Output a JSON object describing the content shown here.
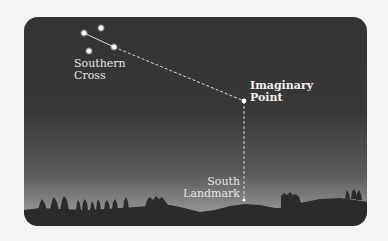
{
  "diagram": {
    "colors": {
      "page_background": "#f4f4f4",
      "sky_top": "#333333",
      "sky_horizon": "#a8a8a8",
      "ground": "#2a2a2a",
      "stars": "#ffffff",
      "guide_line": "#dddddd",
      "label_text": "#e6e6e6"
    },
    "labels": {
      "southern_cross": {
        "line1": "Southern",
        "line2": "Cross"
      },
      "imaginary_point": {
        "line1": "Imaginary",
        "line2": "Point"
      },
      "south_landmark": {
        "line1": "South",
        "line2": "Landmark"
      }
    },
    "stars": [
      {
        "name": "southern-cross-star-top-left",
        "x": 84,
        "y": 33
      },
      {
        "name": "southern-cross-star-top-right",
        "x": 101,
        "y": 28
      },
      {
        "name": "southern-cross-star-right",
        "x": 114,
        "y": 47
      },
      {
        "name": "southern-cross-star-bottom",
        "x": 89,
        "y": 51
      }
    ],
    "points": {
      "imaginary_point": {
        "x": 244,
        "y": 101
      },
      "south_landmark": {
        "x": 244,
        "y": 200
      }
    }
  }
}
